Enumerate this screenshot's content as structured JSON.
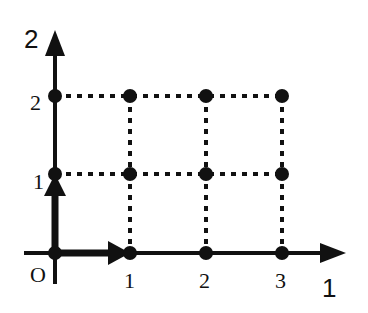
{
  "diagram": {
    "type": "lattice-grid",
    "axes": {
      "vertical": {
        "label": "2"
      },
      "horizontal": {
        "label": "1"
      },
      "origin_label": "O"
    },
    "x_ticks": [
      "1",
      "2",
      "3"
    ],
    "y_ticks": [
      "1",
      "2"
    ],
    "points": [
      [
        0,
        0
      ],
      [
        1,
        0
      ],
      [
        2,
        0
      ],
      [
        3,
        0
      ],
      [
        0,
        1
      ],
      [
        1,
        1
      ],
      [
        2,
        1
      ],
      [
        3,
        1
      ],
      [
        0,
        2
      ],
      [
        1,
        2
      ],
      [
        2,
        2
      ],
      [
        3,
        2
      ]
    ],
    "basis_arrows": [
      {
        "from": [
          0,
          0
        ],
        "to": [
          1,
          0
        ]
      },
      {
        "from": [
          0,
          0
        ],
        "to": [
          0,
          1
        ]
      }
    ],
    "grid_style": "dotted",
    "colors": {
      "ink": "#111111",
      "background": "#ffffff"
    }
  }
}
